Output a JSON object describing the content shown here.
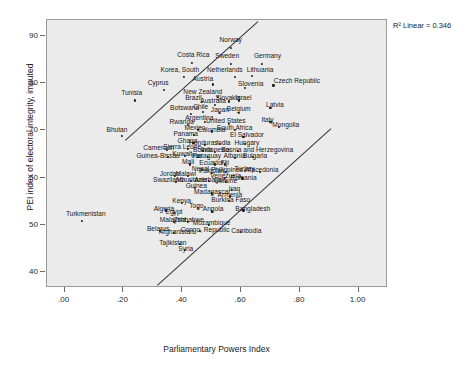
{
  "chart_data": {
    "type": "scatter",
    "title": "",
    "xlabel": "Parliamentary Powers Index",
    "ylabel": "PEI index of electoral integrity, imputed",
    "annotation": "R² Linear = 0.346",
    "xlim": [
      -0.06,
      1.1
    ],
    "ylim": [
      36.5,
      93.5
    ],
    "xticks": [
      ".00",
      ".20",
      ".40",
      ".60",
      ".80",
      "1.00"
    ],
    "xtick_values": [
      0.0,
      0.2,
      0.4,
      0.6,
      0.8,
      1.0
    ],
    "yticks": [
      "40",
      "50",
      "60",
      "70",
      "80",
      "90"
    ],
    "ytick_values": [
      40,
      50,
      60,
      70,
      80,
      90
    ],
    "grid": false,
    "legend": "none",
    "lines": [
      {
        "name": "upper-band",
        "x1": 0.205,
        "y1": 68.0,
        "x2": 0.655,
        "y2": 93.2
      },
      {
        "name": "lower-band",
        "x1": 0.315,
        "y1": 37.2,
        "x2": 0.905,
        "y2": 70.5
      }
    ],
    "points": [
      {
        "label": "Norway",
        "x": 0.565,
        "y": 87.6,
        "lx": 0.565,
        "ly": 89.2
      },
      {
        "label": "Sweden",
        "x": 0.565,
        "y": 84.2,
        "lx": 0.553,
        "ly": 85.8
      },
      {
        "label": "Germany",
        "x": 0.672,
        "y": 84.2,
        "lx": 0.69,
        "ly": 85.8
      },
      {
        "label": "Costa Rica",
        "x": 0.432,
        "y": 84.4,
        "lx": 0.438,
        "ly": 86.1
      },
      {
        "label": "Korea, South",
        "x": 0.405,
        "y": 81.4,
        "lx": 0.392,
        "ly": 82.9
      },
      {
        "label": "Netherlands",
        "x": 0.58,
        "y": 81.4,
        "lx": 0.545,
        "ly": 82.9
      },
      {
        "label": "Lithuania",
        "x": 0.637,
        "y": 81.6,
        "lx": 0.665,
        "ly": 82.9
      },
      {
        "label": "Austria",
        "x": 0.505,
        "y": 79.8,
        "lx": 0.47,
        "ly": 80.9
      },
      {
        "label": "Slovenia",
        "x": 0.612,
        "y": 79.0,
        "lx": 0.633,
        "ly": 79.9
      },
      {
        "label": "Czech Republic",
        "x": 0.71,
        "y": 79.6,
        "lx": 0.79,
        "ly": 80.6
      },
      {
        "label": "Cyprus",
        "x": 0.338,
        "y": 78.6,
        "lx": 0.318,
        "ly": 80.1
      },
      {
        "label": "New Zealand",
        "x": 0.52,
        "y": 77.2,
        "lx": 0.47,
        "ly": 78.2
      },
      {
        "label": "Slovakia",
        "x": 0.56,
        "y": 76.2,
        "lx": 0.556,
        "ly": 77.0
      },
      {
        "label": "Israel",
        "x": 0.592,
        "y": 76.4,
        "lx": 0.608,
        "ly": 77.0
      },
      {
        "label": "Tunisia",
        "x": 0.24,
        "y": 76.4,
        "lx": 0.228,
        "ly": 77.9
      },
      {
        "label": "Brazil",
        "x": 0.468,
        "y": 76.0,
        "lx": 0.438,
        "ly": 76.9
      },
      {
        "label": "Australia",
        "x": 0.51,
        "y": 75.4,
        "lx": 0.505,
        "ly": 76.3
      },
      {
        "label": "Latvia",
        "x": 0.7,
        "y": 74.8,
        "lx": 0.715,
        "ly": 75.4
      },
      {
        "label": "Chile",
        "x": 0.47,
        "y": 74.0,
        "lx": 0.463,
        "ly": 74.9
      },
      {
        "label": "Japan",
        "x": 0.528,
        "y": 73.8,
        "lx": 0.528,
        "ly": 74.4
      },
      {
        "label": "Belgium",
        "x": 0.592,
        "y": 73.8,
        "lx": 0.592,
        "ly": 74.6
      },
      {
        "label": "Botswana",
        "x": 0.43,
        "y": 73.6,
        "lx": 0.408,
        "ly": 74.7
      },
      {
        "label": "Argentina",
        "x": 0.478,
        "y": 71.8,
        "lx": 0.458,
        "ly": 72.6
      },
      {
        "label": "United States",
        "x": 0.56,
        "y": 71.4,
        "lx": 0.548,
        "ly": 72.0
      },
      {
        "label": "Italy",
        "x": 0.7,
        "y": 71.8,
        "lx": 0.69,
        "ly": 72.3
      },
      {
        "label": "Rwanda",
        "x": 0.42,
        "y": 71.2,
        "lx": 0.398,
        "ly": 71.9
      },
      {
        "label": "Mongolia",
        "x": 0.728,
        "y": 70.8,
        "lx": 0.752,
        "ly": 71.1
      },
      {
        "label": "Mexico",
        "x": 0.452,
        "y": 70.2,
        "lx": 0.443,
        "ly": 70.5
      },
      {
        "label": "Colombia",
        "x": 0.5,
        "y": 69.8,
        "lx": 0.5,
        "ly": 70.1
      },
      {
        "label": "South Africa",
        "x": 0.578,
        "y": 70.2,
        "lx": 0.578,
        "ly": 70.5
      },
      {
        "label": "Bhutan",
        "x": 0.195,
        "y": 68.8,
        "lx": 0.178,
        "ly": 70.1
      },
      {
        "label": "Panama",
        "x": 0.44,
        "y": 69.0,
        "lx": 0.412,
        "ly": 69.3
      },
      {
        "label": "El Salvador",
        "x": 0.608,
        "y": 68.6,
        "lx": 0.62,
        "ly": 69.1
      },
      {
        "label": "Ghana",
        "x": 0.438,
        "y": 67.4,
        "lx": 0.418,
        "ly": 67.8
      },
      {
        "label": "Honduras",
        "x": 0.478,
        "y": 67.0,
        "lx": 0.472,
        "ly": 67.3
      },
      {
        "label": "India",
        "x": 0.527,
        "y": 67.2,
        "lx": 0.54,
        "ly": 67.4
      },
      {
        "label": "Hungary",
        "x": 0.612,
        "y": 67.2,
        "lx": 0.62,
        "ly": 67.4
      },
      {
        "label": "Cameroon",
        "x": 0.348,
        "y": 65.8,
        "lx": 0.32,
        "ly": 66.2
      },
      {
        "label": "Sierra Leone",
        "x": 0.42,
        "y": 66.0,
        "lx": 0.4,
        "ly": 66.4
      },
      {
        "label": "Bolivia",
        "x": 0.47,
        "y": 65.6,
        "lx": 0.47,
        "ly": 65.9
      },
      {
        "label": "Indonesia",
        "x": 0.512,
        "y": 65.4,
        "lx": 0.512,
        "ly": 65.8
      },
      {
        "label": "Bosnia and Herzegovina",
        "x": 0.59,
        "y": 65.6,
        "lx": 0.655,
        "ly": 65.9
      },
      {
        "label": "Guinea-Bissau",
        "x": 0.352,
        "y": 64.4,
        "lx": 0.318,
        "ly": 64.6
      },
      {
        "label": "Kuwait",
        "x": 0.408,
        "y": 64.6,
        "lx": 0.4,
        "ly": 65.0
      },
      {
        "label": "Iran",
        "x": 0.452,
        "y": 64.4,
        "lx": 0.45,
        "ly": 64.6
      },
      {
        "label": "Paraguay",
        "x": 0.488,
        "y": 64.4,
        "lx": 0.484,
        "ly": 64.6
      },
      {
        "label": "Albania",
        "x": 0.578,
        "y": 64.2,
        "lx": 0.578,
        "ly": 64.5
      },
      {
        "label": "Bulgaria",
        "x": 0.64,
        "y": 64.4,
        "lx": 0.648,
        "ly": 64.6
      },
      {
        "label": "Mali",
        "x": 0.425,
        "y": 62.8,
        "lx": 0.42,
        "ly": 63.4
      },
      {
        "label": "Ecuador",
        "x": 0.512,
        "y": 62.8,
        "lx": 0.5,
        "ly": 63.1
      },
      {
        "label": "Fiji",
        "x": 0.545,
        "y": 62.8,
        "lx": 0.545,
        "ly": 63.1
      },
      {
        "label": "Nepal",
        "x": 0.468,
        "y": 61.6,
        "lx": 0.462,
        "ly": 61.9
      },
      {
        "label": "Pakistan",
        "x": 0.5,
        "y": 61.0,
        "lx": 0.5,
        "ly": 61.3
      },
      {
        "label": "Philippines",
        "x": 0.548,
        "y": 61.2,
        "lx": 0.552,
        "ly": 61.5
      },
      {
        "label": "Turkey",
        "x": 0.612,
        "y": 61.4,
        "lx": 0.612,
        "ly": 61.8
      },
      {
        "label": "Macedonia",
        "x": 0.665,
        "y": 61.2,
        "lx": 0.672,
        "ly": 61.5
      },
      {
        "label": "Jordan",
        "x": 0.375,
        "y": 60.4,
        "lx": 0.358,
        "ly": 60.8
      },
      {
        "label": "Malawi",
        "x": 0.418,
        "y": 60.4,
        "lx": 0.412,
        "ly": 60.8
      },
      {
        "label": "Venezuela",
        "x": 0.545,
        "y": 60.0,
        "lx": 0.548,
        "ly": 60.3
      },
      {
        "label": "Romania",
        "x": 0.605,
        "y": 59.8,
        "lx": 0.608,
        "ly": 60.0
      },
      {
        "label": "Swaziland",
        "x": 0.378,
        "y": 59.0,
        "lx": 0.352,
        "ly": 59.4
      },
      {
        "label": "Mauritania",
        "x": 0.43,
        "y": 59.2,
        "lx": 0.432,
        "ly": 59.5
      },
      {
        "label": "Azerbaijan",
        "x": 0.492,
        "y": 59.2,
        "lx": 0.494,
        "ly": 59.5
      },
      {
        "label": "Ukraine",
        "x": 0.548,
        "y": 59.0,
        "lx": 0.548,
        "ly": 59.3
      },
      {
        "label": "Guinea",
        "x": 0.442,
        "y": 57.8,
        "lx": 0.448,
        "ly": 58.2
      },
      {
        "label": "Iraq",
        "x": 0.57,
        "y": 57.4,
        "lx": 0.578,
        "ly": 57.6
      },
      {
        "label": "Madagascar",
        "x": 0.5,
        "y": 56.6,
        "lx": 0.502,
        "ly": 56.9
      },
      {
        "label": "Armenia",
        "x": 0.562,
        "y": 56.0,
        "lx": 0.562,
        "ly": 56.2
      },
      {
        "label": "Turkmenistan",
        "x": 0.06,
        "y": 50.8,
        "lx": 0.072,
        "ly": 52.2
      },
      {
        "label": "Kenya",
        "x": 0.4,
        "y": 54.6,
        "lx": 0.398,
        "ly": 55.0
      },
      {
        "label": "Burkina Faso",
        "x": 0.56,
        "y": 55.0,
        "lx": 0.565,
        "ly": 55.3
      },
      {
        "label": "Algeria",
        "x": 0.345,
        "y": 53.0,
        "lx": 0.338,
        "ly": 53.4
      },
      {
        "label": "Togo",
        "x": 0.452,
        "y": 53.6,
        "lx": 0.448,
        "ly": 54.0
      },
      {
        "label": "Egypt",
        "x": 0.372,
        "y": 52.4,
        "lx": 0.372,
        "ly": 52.7
      },
      {
        "label": "Angola",
        "x": 0.5,
        "y": 52.8,
        "lx": 0.505,
        "ly": 53.2
      },
      {
        "label": "Bangladesh",
        "x": 0.608,
        "y": 53.0,
        "lx": 0.64,
        "ly": 53.3
      },
      {
        "label": "Malaysia",
        "x": 0.372,
        "y": 50.6,
        "lx": 0.368,
        "ly": 51.0
      },
      {
        "label": "Zimbabwe",
        "x": 0.42,
        "y": 50.6,
        "lx": 0.422,
        "ly": 51.0
      },
      {
        "label": "Mozambique",
        "x": 0.492,
        "y": 50.0,
        "lx": 0.5,
        "ly": 50.3
      },
      {
        "label": "Belarus",
        "x": 0.325,
        "y": 48.6,
        "lx": 0.318,
        "ly": 49.0
      },
      {
        "label": "Afghanistan",
        "x": 0.372,
        "y": 48.2,
        "lx": 0.38,
        "ly": 48.5
      },
      {
        "label": "Congo, Republic",
        "x": 0.46,
        "y": 48.6,
        "lx": 0.478,
        "ly": 48.9
      },
      {
        "label": "Cambodia",
        "x": 0.6,
        "y": 48.4,
        "lx": 0.618,
        "ly": 48.6
      },
      {
        "label": "Tajikistan",
        "x": 0.392,
        "y": 45.8,
        "lx": 0.368,
        "ly": 46.1
      },
      {
        "label": "Syria",
        "x": 0.408,
        "y": 44.6,
        "lx": 0.412,
        "ly": 44.8
      }
    ]
  }
}
